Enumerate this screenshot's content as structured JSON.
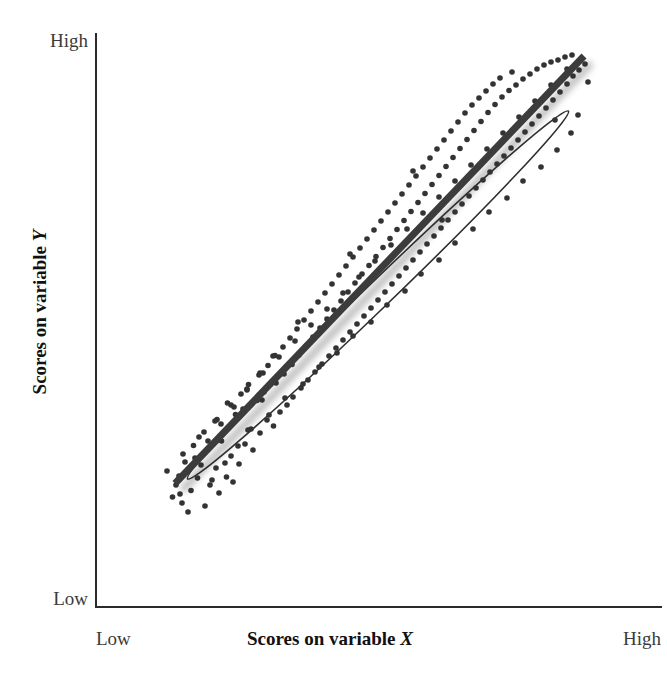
{
  "figure": {
    "background_color": "#ffffff",
    "ink_color": "#2f2f2f"
  },
  "axes": {
    "x_axis": {
      "title": "Scores on variable ",
      "title_variable": "X",
      "low_label": "Low",
      "high_label": "High",
      "line_color": "#2b2b2b"
    },
    "y_axis": {
      "title": "Scores on variable ",
      "title_variable": "Y",
      "low_label": "Low",
      "high_label": "High",
      "line_color": "#2b2b2b"
    }
  },
  "chart_data": {
    "type": "scatter",
    "title": "",
    "xlabel": "Scores on variable X",
    "ylabel": "Scores on variable Y",
    "xlim": [
      0,
      100
    ],
    "ylim": [
      0,
      100
    ],
    "xtick_labels": [
      "Low",
      "High"
    ],
    "ytick_labels": [
      "Low",
      "High"
    ],
    "grid": false,
    "legend": null,
    "annotations": [
      {
        "type": "ellipse",
        "name": "correlation-envelope",
        "center": [
          50,
          50
        ],
        "rotation_deg": -44,
        "semi_major": 52,
        "semi_minor": 11,
        "stroke": "#2f2f2f"
      },
      {
        "type": "line",
        "name": "regression-line",
        "x": [
          9.4,
          91.2
        ],
        "y": [
          12.3,
          97.8
        ],
        "stroke": "#3c3c3c",
        "width": 7,
        "shadow": true
      }
    ],
    "relationship": "strong positive linear correlation",
    "marker": {
      "shape": "circle",
      "size": 5.6,
      "color": "#333333"
    },
    "points": [
      [
        8.9,
        9.6
      ],
      [
        10.8,
        8.4
      ],
      [
        12.6,
        10.9
      ],
      [
        10.2,
        13.8
      ],
      [
        13.9,
        13.4
      ],
      [
        16.4,
        12.0
      ],
      [
        14.6,
        16.0
      ],
      [
        11.4,
        16.6
      ],
      [
        17.6,
        15.4
      ],
      [
        19.7,
        13.6
      ],
      [
        16.0,
        19.1
      ],
      [
        13.1,
        19.9
      ],
      [
        20.6,
        17.8
      ],
      [
        22.2,
        16.2
      ],
      [
        18.7,
        20.8
      ],
      [
        15.2,
        22.6
      ],
      [
        23.4,
        20.2
      ],
      [
        20.1,
        23.4
      ],
      [
        25.0,
        19.0
      ],
      [
        24.0,
        23.0
      ],
      [
        17.8,
        25.1
      ],
      [
        21.5,
        26.1
      ],
      [
        26.4,
        22.4
      ],
      [
        27.8,
        25.0
      ],
      [
        23.0,
        27.2
      ],
      [
        19.9,
        28.4
      ],
      [
        29.1,
        23.8
      ],
      [
        25.8,
        28.9
      ],
      [
        30.4,
        26.6
      ],
      [
        22.6,
        30.2
      ],
      [
        27.2,
        30.6
      ],
      [
        31.8,
        28.0
      ],
      [
        24.1,
        32.1
      ],
      [
        29.6,
        32.4
      ],
      [
        33.0,
        29.6
      ],
      [
        26.2,
        34.0
      ],
      [
        31.2,
        34.2
      ],
      [
        34.6,
        31.4
      ],
      [
        28.0,
        35.9
      ],
      [
        36.0,
        33.0
      ],
      [
        32.8,
        36.1
      ],
      [
        29.4,
        37.9
      ],
      [
        37.4,
        34.6
      ],
      [
        34.2,
        38.0
      ],
      [
        31.0,
        39.6
      ],
      [
        38.8,
        36.2
      ],
      [
        35.6,
        39.8
      ],
      [
        32.4,
        41.4
      ],
      [
        40.2,
        37.8
      ],
      [
        37.0,
        41.6
      ],
      [
        33.8,
        43.2
      ],
      [
        41.6,
        39.4
      ],
      [
        38.4,
        43.4
      ],
      [
        35.2,
        45.0
      ],
      [
        43.0,
        41.0
      ],
      [
        39.8,
        45.2
      ],
      [
        36.6,
        46.8
      ],
      [
        44.4,
        42.6
      ],
      [
        41.2,
        47.0
      ],
      [
        38.0,
        48.6
      ],
      [
        45.8,
        44.2
      ],
      [
        42.6,
        48.8
      ],
      [
        39.4,
        50.4
      ],
      [
        47.2,
        45.8
      ],
      [
        44.0,
        50.6
      ],
      [
        40.8,
        52.2
      ],
      [
        48.6,
        47.4
      ],
      [
        45.4,
        52.4
      ],
      [
        42.2,
        54.0
      ],
      [
        50.0,
        49.0
      ],
      [
        46.8,
        54.2
      ],
      [
        43.6,
        55.8
      ],
      [
        51.4,
        50.6
      ],
      [
        48.2,
        55.9
      ],
      [
        45.0,
        57.6
      ],
      [
        52.8,
        52.2
      ],
      [
        49.6,
        57.7
      ],
      [
        46.4,
        59.4
      ],
      [
        54.2,
        53.8
      ],
      [
        51.0,
        59.5
      ],
      [
        47.8,
        61.2
      ],
      [
        55.6,
        55.4
      ],
      [
        52.4,
        61.3
      ],
      [
        49.2,
        63.0
      ],
      [
        57.0,
        57.0
      ],
      [
        53.8,
        63.1
      ],
      [
        50.6,
        64.8
      ],
      [
        58.4,
        58.6
      ],
      [
        55.2,
        64.9
      ],
      [
        52.0,
        66.6
      ],
      [
        59.8,
        60.2
      ],
      [
        56.6,
        66.7
      ],
      [
        53.4,
        68.4
      ],
      [
        61.2,
        61.8
      ],
      [
        58.0,
        68.5
      ],
      [
        54.8,
        70.2
      ],
      [
        62.6,
        63.4
      ],
      [
        59.4,
        70.3
      ],
      [
        56.2,
        72.0
      ],
      [
        64.0,
        65.0
      ],
      [
        60.8,
        72.1
      ],
      [
        57.6,
        73.8
      ],
      [
        65.4,
        66.6
      ],
      [
        62.2,
        73.9
      ],
      [
        59.0,
        75.6
      ],
      [
        66.8,
        68.2
      ],
      [
        63.6,
        75.7
      ],
      [
        60.4,
        77.4
      ],
      [
        68.2,
        69.8
      ],
      [
        65.0,
        77.5
      ],
      [
        61.8,
        79.2
      ],
      [
        69.6,
        71.4
      ],
      [
        66.4,
        79.3
      ],
      [
        63.2,
        81.0
      ],
      [
        71.0,
        73.0
      ],
      [
        67.8,
        81.1
      ],
      [
        64.6,
        82.8
      ],
      [
        72.4,
        74.6
      ],
      [
        69.2,
        82.9
      ],
      [
        66.0,
        84.6
      ],
      [
        73.8,
        76.2
      ],
      [
        70.6,
        84.7
      ],
      [
        67.4,
        86.4
      ],
      [
        75.2,
        77.8
      ],
      [
        72.0,
        86.5
      ],
      [
        68.8,
        88.0
      ],
      [
        76.6,
        79.4
      ],
      [
        73.4,
        88.1
      ],
      [
        70.2,
        89.4
      ],
      [
        78.0,
        81.0
      ],
      [
        74.8,
        89.6
      ],
      [
        71.6,
        90.8
      ],
      [
        79.4,
        82.6
      ],
      [
        76.2,
        90.9
      ],
      [
        73.0,
        92.2
      ],
      [
        80.8,
        84.2
      ],
      [
        77.6,
        92.0
      ],
      [
        74.4,
        93.4
      ],
      [
        82.2,
        85.8
      ],
      [
        79.0,
        93.2
      ],
      [
        83.6,
        87.4
      ],
      [
        80.4,
        94.2
      ],
      [
        76.8,
        94.6
      ],
      [
        85.0,
        89.0
      ],
      [
        81.8,
        95.2
      ],
      [
        86.4,
        90.6
      ],
      [
        83.2,
        96.0
      ],
      [
        87.8,
        92.2
      ],
      [
        84.6,
        96.6
      ],
      [
        89.0,
        93.8
      ],
      [
        86.0,
        97.0
      ],
      [
        90.2,
        95.0
      ],
      [
        87.4,
        97.6
      ],
      [
        91.4,
        96.2
      ],
      [
        88.8,
        98.0
      ],
      [
        12.0,
        6.6
      ],
      [
        15.4,
        7.8
      ],
      [
        9.6,
        12.0
      ],
      [
        18.2,
        10.4
      ],
      [
        21.0,
        12.6
      ],
      [
        7.8,
        14.8
      ],
      [
        11.0,
        18.2
      ],
      [
        14.2,
        21.6
      ],
      [
        17.4,
        24.8
      ],
      [
        20.6,
        28.0
      ],
      [
        23.8,
        31.2
      ],
      [
        27.0,
        34.4
      ],
      [
        30.2,
        37.6
      ],
      [
        33.4,
        40.8
      ],
      [
        36.6,
        44.0
      ],
      [
        39.8,
        47.2
      ],
      [
        43.0,
        50.4
      ],
      [
        46.2,
        53.6
      ],
      [
        49.4,
        56.8
      ],
      [
        52.6,
        60.0
      ],
      [
        55.8,
        63.2
      ],
      [
        59.0,
        66.4
      ],
      [
        62.2,
        69.6
      ],
      [
        65.4,
        72.8
      ],
      [
        68.6,
        76.0
      ],
      [
        71.8,
        79.2
      ],
      [
        75.0,
        82.4
      ],
      [
        78.2,
        85.6
      ],
      [
        81.4,
        88.8
      ],
      [
        84.6,
        92.0
      ],
      [
        87.8,
        95.2
      ],
      [
        16.8,
        13.0
      ],
      [
        19.4,
        16.4
      ],
      [
        22.0,
        19.8
      ],
      [
        24.6,
        23.2
      ],
      [
        28.2,
        26.0
      ],
      [
        31.4,
        29.4
      ],
      [
        35.0,
        32.2
      ],
      [
        38.2,
        35.6
      ],
      [
        41.8,
        38.4
      ],
      [
        45.0,
        41.8
      ],
      [
        48.6,
        44.6
      ],
      [
        51.8,
        48.0
      ],
      [
        55.4,
        50.8
      ],
      [
        58.6,
        54.2
      ],
      [
        62.2,
        57.0
      ],
      [
        65.4,
        60.4
      ],
      [
        69.0,
        63.2
      ],
      [
        72.2,
        66.6
      ],
      [
        75.8,
        69.4
      ],
      [
        79.0,
        72.8
      ],
      [
        82.6,
        75.6
      ],
      [
        85.8,
        79.0
      ],
      [
        88.6,
        82.4
      ],
      [
        90.0,
        86.0
      ],
      [
        13.4,
        17.4
      ],
      [
        16.0,
        20.8
      ],
      [
        18.6,
        24.2
      ],
      [
        21.2,
        27.6
      ],
      [
        23.8,
        31.0
      ],
      [
        26.4,
        34.4
      ],
      [
        29.0,
        37.8
      ],
      [
        34.0,
        44.6
      ],
      [
        44.4,
        58.2
      ],
      [
        57.0,
        74.8
      ],
      [
        10.4,
        10.2
      ],
      [
        92.0,
        92.6
      ],
      [
        85.4,
        85.0
      ],
      [
        26.8,
        29.0
      ],
      [
        62.8,
        65.0
      ]
    ]
  }
}
